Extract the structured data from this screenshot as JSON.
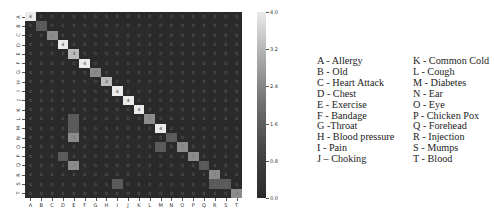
{
  "chart_data": {
    "type": "heatmap",
    "title": "",
    "xlabel": "",
    "ylabel": "",
    "categories": [
      "A",
      "B",
      "C",
      "D",
      "E",
      "F",
      "G",
      "H",
      "I",
      "J",
      "K",
      "L",
      "M",
      "N",
      "O",
      "P",
      "Q",
      "R",
      "S",
      "T"
    ],
    "matrix": [
      [
        4,
        0,
        0,
        0,
        0,
        0,
        0,
        0,
        0,
        0,
        0,
        0,
        0,
        0,
        0,
        0,
        0,
        0,
        0,
        0
      ],
      [
        0,
        1,
        0,
        0,
        0,
        0,
        0,
        0,
        0,
        0,
        0,
        0,
        0,
        0,
        0,
        0,
        0,
        0,
        0,
        0
      ],
      [
        0,
        0,
        2,
        0,
        0,
        0,
        0,
        0,
        0,
        0,
        0,
        0,
        0,
        0,
        0,
        0,
        0,
        0,
        0,
        0
      ],
      [
        0,
        0,
        0,
        4,
        0,
        0,
        0,
        0,
        0,
        0,
        0,
        0,
        0,
        0,
        0,
        0,
        0,
        0,
        0,
        0
      ],
      [
        0,
        0,
        0,
        0,
        3,
        0,
        0,
        0,
        0,
        0,
        0,
        0,
        0,
        0,
        0,
        0,
        0,
        0,
        0,
        0
      ],
      [
        0,
        0,
        0,
        0,
        0,
        4,
        0,
        0,
        0,
        0,
        0,
        0,
        0,
        0,
        0,
        0,
        0,
        0,
        0,
        0
      ],
      [
        0,
        0,
        0,
        0,
        0,
        0,
        2,
        0,
        0,
        0,
        0,
        0,
        0,
        0,
        0,
        0,
        0,
        0,
        0,
        0
      ],
      [
        0,
        0,
        0,
        0,
        0,
        0,
        0,
        3,
        0,
        0,
        0,
        0,
        0,
        0,
        0,
        0,
        0,
        0,
        0,
        0
      ],
      [
        0,
        0,
        0,
        0,
        0,
        0,
        0,
        0,
        4,
        0,
        0,
        0,
        0,
        0,
        0,
        0,
        0,
        0,
        0,
        0
      ],
      [
        0,
        0,
        0,
        0,
        0,
        0,
        0,
        0,
        0,
        4,
        0,
        0,
        0,
        0,
        0,
        0,
        0,
        0,
        0,
        0
      ],
      [
        0,
        0,
        0,
        0,
        0,
        0,
        0,
        0,
        0,
        0,
        4,
        0,
        0,
        0,
        0,
        0,
        0,
        0,
        0,
        0
      ],
      [
        0,
        0,
        0,
        0,
        1,
        0,
        0,
        0,
        0,
        0,
        0,
        2,
        0,
        0,
        0,
        0,
        0,
        0,
        0,
        0
      ],
      [
        0,
        0,
        0,
        0,
        1,
        0,
        0,
        0,
        0,
        0,
        0,
        0,
        4,
        0,
        0,
        0,
        0,
        0,
        0,
        0
      ],
      [
        0,
        0,
        0,
        0,
        2,
        0,
        0,
        0,
        0,
        0,
        0,
        0,
        0,
        1,
        0,
        0,
        0,
        0,
        0,
        0
      ],
      [
        0,
        0,
        0,
        0,
        0,
        0,
        0,
        0,
        0,
        0,
        0,
        0,
        1,
        0,
        2,
        0,
        0,
        0,
        0,
        0
      ],
      [
        0,
        0,
        0,
        1,
        0,
        0,
        0,
        0,
        0,
        0,
        0,
        0,
        0,
        0,
        0,
        2,
        0,
        0,
        0,
        0
      ],
      [
        0,
        0,
        0,
        0,
        2,
        0,
        0,
        0,
        0,
        0,
        0,
        0,
        0,
        0,
        0,
        0,
        1,
        0,
        0,
        0
      ],
      [
        0,
        0,
        0,
        0,
        0,
        0,
        0,
        0,
        0,
        0,
        0,
        0,
        0,
        0,
        0,
        0,
        0,
        2,
        0,
        0
      ],
      [
        0,
        0,
        0,
        0,
        0,
        0,
        0,
        0,
        1,
        0,
        0,
        0,
        0,
        0,
        0,
        0,
        0,
        1,
        1,
        0
      ],
      [
        0,
        0,
        0,
        0,
        0,
        0,
        0,
        0,
        0,
        0,
        0,
        0,
        0,
        0,
        0,
        0,
        0,
        0,
        0,
        2
      ]
    ],
    "colorbar": {
      "min": 0.0,
      "max": 4.0,
      "ticks": [
        "4.0",
        "3.2",
        "2.4",
        "1.6",
        "0.8",
        "0.0"
      ]
    },
    "annotations": "cell values shown",
    "grid": false,
    "legend_position": "right"
  },
  "legend": {
    "left": [
      "A - Allergy",
      "B - Old",
      "C - Heart Attack",
      "D - Chest",
      "E - Exercise",
      "F - Bandage",
      "G -Throat",
      "H - Blood pressure",
      "I  - Pain",
      "J – Choking"
    ],
    "right": [
      "K - Common Cold",
      "L  - Cough",
      "M - Diabetes",
      "N - Ear",
      "O - Eye",
      "P - Chicken Pox",
      "Q - Forehead",
      "R - Injection",
      "S - Mumps",
      "T - Blood"
    ]
  }
}
